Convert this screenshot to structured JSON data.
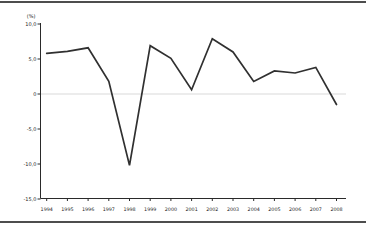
{
  "chart_data": {
    "type": "line",
    "title": "",
    "unit_label": "(%)",
    "xlabel": "",
    "ylabel": "(%)",
    "categories": [
      "1994",
      "1995",
      "1996",
      "1997",
      "1998",
      "1999",
      "2000",
      "2001",
      "2002",
      "2003",
      "2004",
      "2005",
      "2006",
      "2007",
      "2008"
    ],
    "values": [
      5.8,
      6.1,
      6.6,
      1.8,
      -10.2,
      6.9,
      5.1,
      0.6,
      7.9,
      6.0,
      1.8,
      3.3,
      3.0,
      3.8,
      -1.5
    ],
    "ylim": [
      -15,
      10
    ],
    "y_tick_values": [
      10,
      5,
      0,
      -5,
      -10,
      -15
    ],
    "y_tick_labels": [
      "10,0",
      "5,0",
      "0",
      "-5,0",
      "-10,0",
      "-15,0"
    ],
    "grid": "zero-line-only",
    "legend": "none",
    "line_color": "#303030",
    "zero_line_color": "#d9d9d9",
    "axis_color": "#2a2a2a",
    "border_rule_color": "#4d4d4d",
    "background_color": "#ffffff"
  }
}
